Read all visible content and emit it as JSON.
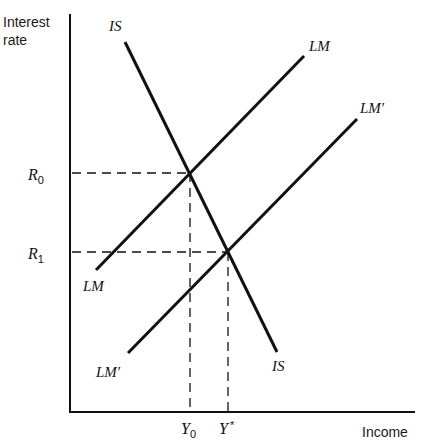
{
  "diagram": {
    "type": "IS-LM model",
    "y_axis_title_line1": "Interest",
    "y_axis_title_line2": "rate",
    "x_axis_title": "Income",
    "curves": [
      {
        "id": "IS",
        "label_top": "IS",
        "label_bottom": "IS",
        "slope": "downward"
      },
      {
        "id": "LM",
        "label_top": "LM",
        "label_bottom": "LM",
        "slope": "upward"
      },
      {
        "id": "LM_prime",
        "label_top": "LM′",
        "label_bottom": "LM′",
        "slope": "upward"
      }
    ],
    "y_ticks": [
      {
        "symbol": "R",
        "subscript": "0",
        "meaning": "initial interest rate (IS ∩ LM)"
      },
      {
        "symbol": "R",
        "subscript": "1",
        "meaning": "new interest rate (IS ∩ LM′)"
      }
    ],
    "x_ticks": [
      {
        "symbol": "Y",
        "subscript": "0",
        "meaning": "initial income"
      },
      {
        "symbol": "Y",
        "superscript": "*",
        "meaning": "equilibrium income after shift"
      }
    ],
    "equilibria": [
      {
        "curves": [
          "IS",
          "LM"
        ],
        "x_label": "Y0",
        "y_label": "R0"
      },
      {
        "curves": [
          "IS",
          "LM′"
        ],
        "x_label": "Y*",
        "y_label": "R1"
      }
    ]
  }
}
